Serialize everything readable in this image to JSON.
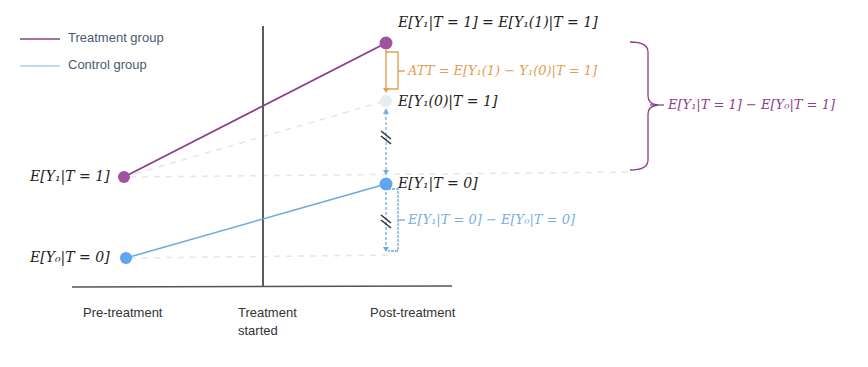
{
  "legend": {
    "items": [
      {
        "label": "Treatment group",
        "color": "#8e3d8c"
      },
      {
        "label": "Control group",
        "color": "#6aa8e0"
      }
    ]
  },
  "axis": {
    "x_labels": [
      "Pre-treatment",
      "Treatment\nstarted",
      "Post-treatment"
    ],
    "x_label_pre": "Pre-treatment",
    "x_label_mid_line1": "Treatment",
    "x_label_mid_line2": "started",
    "x_label_post": "Post-treatment"
  },
  "points": {
    "treat_pre": {
      "label": "E[Y₁|T = 1]",
      "color": "#a0529e"
    },
    "control_pre": {
      "label": "E[Y₀|T = 0]",
      "color": "#5ea6ee"
    },
    "treat_post": {
      "label": "E[Y₁|T = 1] = E[Y₁(1)|T = 1]",
      "color": "#a0529e"
    },
    "counterfactual_post": {
      "label": "E[Y₁(0)|T = 1]",
      "color": "#dde8f0"
    },
    "control_post": {
      "label": "E[Y₁|T = 0]",
      "color": "#5ea6ee"
    }
  },
  "annotations": {
    "att": {
      "label": "ATT = E[Y₁(1) − Y₁(0)|T = 1]",
      "color": "#e0a050"
    },
    "control_diff": {
      "label": "E[Y₁|T = 0] − E[Y₀|T = 0]",
      "color": "#7aaee0"
    },
    "treatment_diff": {
      "label": "E[Y₁|T = 1] − E[Y₀|T = 1]",
      "color": "#8e3d8c"
    }
  },
  "colors": {
    "treatment": "#8e3d8c",
    "control": "#6aa8e0",
    "att": "#e0a050",
    "axis": "#333333",
    "dashed": "#e4e4e4"
  }
}
